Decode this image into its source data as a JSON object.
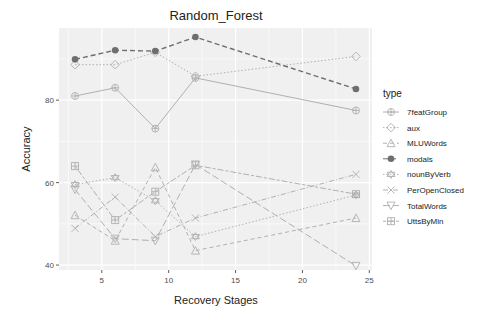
{
  "chart_data": {
    "type": "line",
    "title": "Random_Forest",
    "xlabel": "Recovery Stages",
    "ylabel": "Accuracy",
    "xlim": [
      1.8,
      25.2
    ],
    "ylim": [
      38.8,
      97.5
    ],
    "x_ticks": [
      5,
      10,
      15,
      20,
      25
    ],
    "y_ticks": [
      40,
      60,
      80
    ],
    "grid": true,
    "legend_position": "right",
    "legend_title": "type",
    "x": [
      3,
      6,
      9,
      12,
      24
    ],
    "series": [
      {
        "name": "7featGroup",
        "shape": "circle-plus",
        "linestyle": "solid",
        "values": [
          81.0,
          83.0,
          73.1,
          85.4,
          77.5
        ]
      },
      {
        "name": "aux",
        "shape": "diamond",
        "linestyle": "dotted",
        "values": [
          88.6,
          88.6,
          91.6,
          85.8,
          90.6
        ]
      },
      {
        "name": "MLUWords",
        "shape": "triangle",
        "linestyle": "dashed",
        "values": [
          52.1,
          45.9,
          63.7,
          43.5,
          51.4
        ]
      },
      {
        "name": "modals",
        "shape": "filled-circle",
        "linestyle": "dashed-bold",
        "values": [
          89.9,
          92.1,
          91.9,
          95.3,
          82.7
        ]
      },
      {
        "name": "nounByVerb",
        "shape": "star-of-david",
        "linestyle": "dotted",
        "values": [
          59.5,
          61.2,
          55.6,
          46.9,
          57.0
        ]
      },
      {
        "name": "PerOpenClosed",
        "shape": "cross",
        "linestyle": "dashdot",
        "values": [
          48.9,
          56.5,
          46.9,
          51.4,
          62.0
        ]
      },
      {
        "name": "TotalWords",
        "shape": "down-triangle",
        "linestyle": "longdash",
        "values": [
          58.3,
          46.4,
          45.9,
          64.4,
          39.8
        ]
      },
      {
        "name": "UttsByMin",
        "shape": "square-plus",
        "linestyle": "twodash",
        "values": [
          64.0,
          50.9,
          57.8,
          64.2,
          57.2
        ]
      }
    ]
  },
  "colors": {
    "panel_bg": "#f0f0f0",
    "grid": "#ffffff",
    "series_gray": "#b0b0b0",
    "modals": "#6e6e6e"
  }
}
